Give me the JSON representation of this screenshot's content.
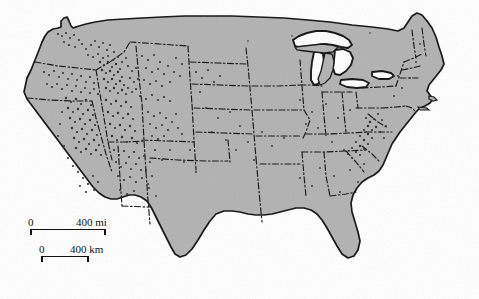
{
  "map": {
    "title": "Dot distribution map of the contiguous United States",
    "region": "Contiguous United States (lower 48 states)",
    "projection_note": "Curved northern border (conic projection)",
    "land_fill_color": "#b2b2b2",
    "background_color": "#ffffff",
    "outline_color": "#111111",
    "state_border_style": "dash-dot",
    "lake_fill_color": "#ffffff",
    "dot_color": "#2b2b2b",
    "dot_symbol": "filled-circle",
    "features": {
      "great_lakes": [
        "Lake Superior",
        "Lake Michigan",
        "Lake Huron",
        "Lake Erie",
        "Lake Ontario"
      ],
      "coastlines": [
        "Pacific",
        "Atlantic",
        "Gulf of Mexico"
      ]
    },
    "dot_clusters": [
      {
        "name": "Intermountain West",
        "density": "very-high"
      },
      {
        "name": "Idaho / western Montana",
        "density": "very-high"
      },
      {
        "name": "Nevada / eastern California",
        "density": "high"
      },
      {
        "name": "Utah",
        "density": "high"
      },
      {
        "name": "Oregon",
        "density": "high"
      },
      {
        "name": "Arizona / New Mexico",
        "density": "moderate"
      },
      {
        "name": "Colorado",
        "density": "moderate"
      },
      {
        "name": "Appalachians (West Virginia / Virginia)",
        "density": "moderate"
      },
      {
        "name": "Great Plains",
        "density": "low"
      },
      {
        "name": "Southeast",
        "density": "very-low"
      }
    ]
  },
  "scale": {
    "miles": {
      "zero_label": "0",
      "max_label": "400 mi",
      "value": 400,
      "unit": "mi"
    },
    "kilometers": {
      "zero_label": "0",
      "max_label": "400 km",
      "value": 400,
      "unit": "km"
    }
  }
}
